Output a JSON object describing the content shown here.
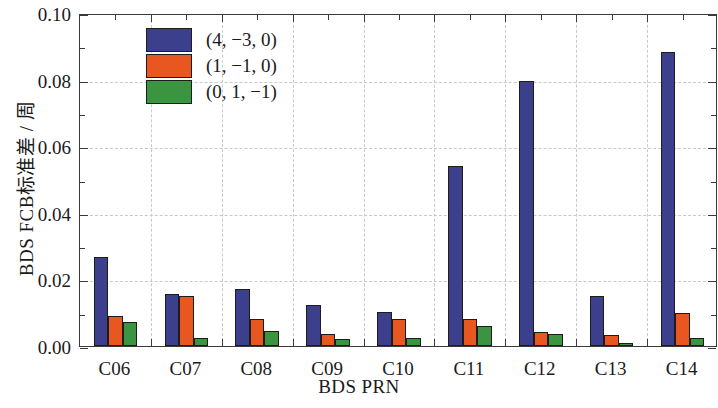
{
  "chart_data": {
    "type": "bar",
    "title": "",
    "xlabel": "BDS PRN",
    "ylabel": "BDS FCB标准差 / 周",
    "categories": [
      "C06",
      "C07",
      "C08",
      "C09",
      "C10",
      "C11",
      "C12",
      "C13",
      "C14"
    ],
    "ylim": [
      0.0,
      0.1
    ],
    "yticks": [
      "0.00",
      "0.02",
      "0.04",
      "0.06",
      "0.08",
      "0.10"
    ],
    "ytick_values": [
      0.0,
      0.02,
      0.04,
      0.06,
      0.08,
      0.1
    ],
    "grid": "dashed-both",
    "legend_position": "top-left-inside",
    "series": [
      {
        "name": "(4, −3, 0)",
        "color": "#3b3f8c",
        "values": [
          0.0267,
          0.0155,
          0.0172,
          0.0123,
          0.0102,
          0.0541,
          0.0796,
          0.015,
          0.0884
        ]
      },
      {
        "name": "(1, −1, 0)",
        "color": "#e8571f",
        "values": [
          0.009,
          0.015,
          0.0082,
          0.0037,
          0.008,
          0.008,
          0.0041,
          0.0032,
          0.01
        ]
      },
      {
        "name": "(0, 1, −1)",
        "color": "#3a9440",
        "values": [
          0.0072,
          0.0025,
          0.0045,
          0.002,
          0.0025,
          0.006,
          0.0035,
          0.001,
          0.0025
        ]
      }
    ]
  }
}
